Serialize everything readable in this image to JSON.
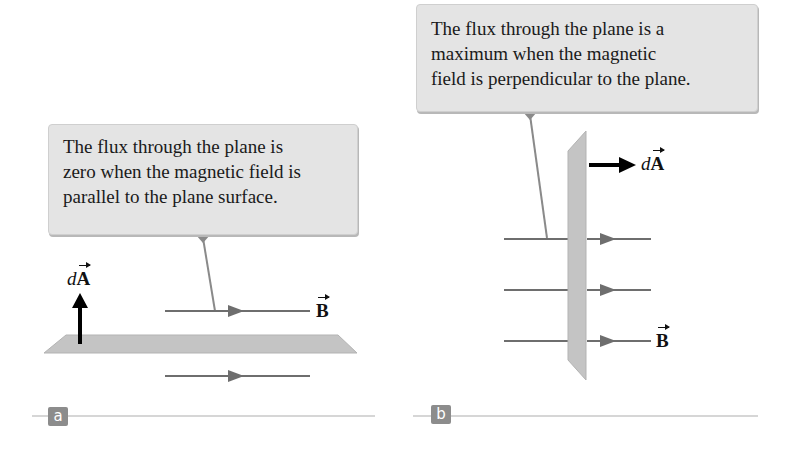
{
  "panels": {
    "a": {
      "tag": "a",
      "callout": {
        "lines": [
          "The flux through the plane is",
          "zero when the magnetic field is",
          "parallel to the plane surface."
        ]
      },
      "area_vector_label": {
        "prefix": "d",
        "symbol": "A"
      },
      "field_vector_label": {
        "symbol": "B"
      }
    },
    "b": {
      "tag": "b",
      "callout": {
        "lines": [
          "The flux through the plane is a",
          "maximum when the magnetic",
          "field is perpendicular to the plane."
        ]
      },
      "area_vector_label": {
        "prefix": "d",
        "symbol": "A"
      },
      "field_vector_label": {
        "symbol": "B"
      }
    }
  },
  "colors": {
    "callout_bg": "#e4e4e4",
    "plane": "#c4c4c4",
    "field_line": "#6e6e6e",
    "area_vector": "#000000",
    "tag_bg": "#8c8c8c",
    "rule": "#c8c8c8"
  }
}
